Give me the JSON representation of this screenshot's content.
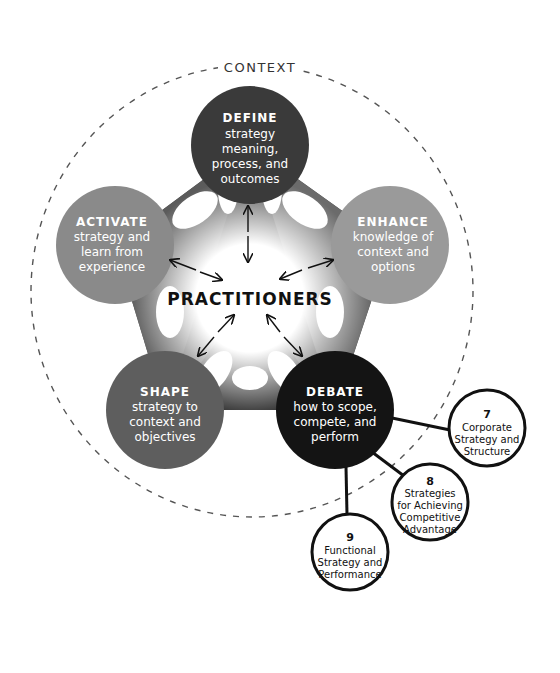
{
  "context_label": "CONTEXT",
  "center_label": "PRACTITIONERS",
  "colors": {
    "define": "#3a3a3a",
    "activate": "#8a8a8a",
    "enhance": "#9a9a9a",
    "shape": "#5e5e5e",
    "debate": "#141414",
    "text_light": "#ffffff",
    "text_dark": "#111111",
    "dashed_circle": "#555555"
  },
  "nodes": {
    "define": {
      "title": "DEFINE",
      "lines": [
        "strategy",
        "meaning,",
        "process, and",
        "outcomes"
      ]
    },
    "enhance": {
      "title": "ENHANCE",
      "lines": [
        "knowledge of",
        "context and",
        "options"
      ]
    },
    "debate": {
      "title": "DEBATE",
      "lines": [
        "how to scope,",
        "compete, and",
        "perform"
      ]
    },
    "shape": {
      "title": "SHAPE",
      "lines": [
        "strategy to",
        "context and",
        "objectives"
      ]
    },
    "activate": {
      "title": "ACTIVATE",
      "lines": [
        "strategy and",
        "learn from",
        "experience"
      ]
    }
  },
  "chapters": [
    {
      "number": "7",
      "lines": [
        "Corporate",
        "Strategy and",
        "Structure"
      ]
    },
    {
      "number": "8",
      "lines": [
        "Strategies",
        "for Achieving",
        "Competitive",
        "Advantage"
      ]
    },
    {
      "number": "9",
      "lines": [
        "Functional",
        "Strategy and",
        "Performance"
      ]
    }
  ]
}
